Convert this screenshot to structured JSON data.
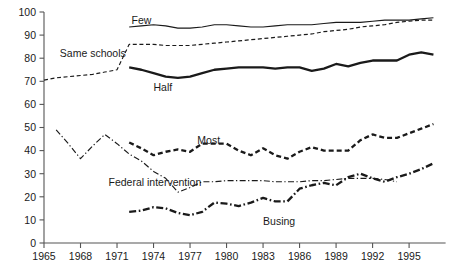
{
  "chart_data": {
    "type": "line",
    "title": "",
    "subtitle": "",
    "xlabel": "",
    "ylabel": "",
    "xlim": [
      1965,
      1998
    ],
    "ylim": [
      0,
      100
    ],
    "grid": false,
    "legend_position": "inline-annotations",
    "xticks": [
      1965,
      1968,
      1971,
      1974,
      1977,
      1980,
      1983,
      1986,
      1989,
      1992,
      1995
    ],
    "xtick_labels": [
      "1965",
      "1968",
      "1971",
      "1974",
      "1977",
      "1980",
      "1983",
      "1986",
      "1989",
      "1992",
      "1995"
    ],
    "yticks": [
      0,
      10,
      20,
      30,
      40,
      50,
      60,
      70,
      80,
      90,
      100
    ],
    "ytick_labels": [
      "0",
      "10",
      "20",
      "30",
      "40",
      "50",
      "60",
      "70",
      "80",
      "90",
      "100"
    ],
    "series": [
      {
        "name": "Few",
        "label": "Few",
        "style": "solid-thin",
        "color": "#333333",
        "label_x": 1972.2,
        "label_y": 96.5,
        "points": [
          [
            1972,
            93.5
          ],
          [
            1973,
            94.0
          ],
          [
            1974,
            94.5
          ],
          [
            1975,
            94.0
          ],
          [
            1976,
            93.0
          ],
          [
            1977,
            93.0
          ],
          [
            1978,
            93.5
          ],
          [
            1979,
            94.5
          ],
          [
            1980,
            94.5
          ],
          [
            1981,
            94.0
          ],
          [
            1982,
            93.5
          ],
          [
            1983,
            93.5
          ],
          [
            1984,
            94.0
          ],
          [
            1985,
            94.5
          ],
          [
            1986,
            94.5
          ],
          [
            1987,
            94.5
          ],
          [
            1988,
            95.0
          ],
          [
            1989,
            95.5
          ],
          [
            1990,
            95.5
          ],
          [
            1991,
            95.5
          ],
          [
            1992,
            96.0
          ],
          [
            1993,
            96.5
          ],
          [
            1994,
            96.5
          ],
          [
            1995,
            96.5
          ],
          [
            1996,
            97.0
          ],
          [
            1997,
            97.5
          ]
        ]
      },
      {
        "name": "Same schools",
        "label": "Same schools",
        "style": "dashed-thin",
        "color": "#222222",
        "label_x": 1966.3,
        "label_y": 82.0,
        "points": [
          [
            1965,
            70.5
          ],
          [
            1966,
            71.5
          ],
          [
            1967,
            72.0
          ],
          [
            1968,
            72.5
          ],
          [
            1969,
            73.0
          ],
          [
            1970,
            74.0
          ],
          [
            1971,
            75.0
          ],
          [
            1972,
            86.0
          ],
          [
            1973,
            86.0
          ],
          [
            1974,
            86.0
          ],
          [
            1975,
            85.5
          ],
          [
            1976,
            85.5
          ],
          [
            1977,
            85.5
          ],
          [
            1978,
            86.0
          ],
          [
            1979,
            86.5
          ],
          [
            1980,
            87.0
          ],
          [
            1981,
            87.5
          ],
          [
            1982,
            88.0
          ],
          [
            1983,
            88.5
          ],
          [
            1984,
            89.0
          ],
          [
            1985,
            89.5
          ],
          [
            1986,
            90.0
          ],
          [
            1987,
            90.5
          ],
          [
            1988,
            91.5
          ],
          [
            1989,
            92.0
          ],
          [
            1990,
            92.5
          ],
          [
            1991,
            93.5
          ],
          [
            1992,
            94.0
          ],
          [
            1993,
            94.5
          ],
          [
            1994,
            95.5
          ],
          [
            1995,
            96.0
          ],
          [
            1996,
            96.5
          ],
          [
            1997,
            96.5
          ]
        ]
      },
      {
        "name": "Half",
        "label": "Half",
        "style": "solid-thick",
        "color": "#111111",
        "label_x": 1974.0,
        "label_y": 67.5,
        "points": [
          [
            1972,
            76.0
          ],
          [
            1973,
            75.0
          ],
          [
            1974,
            73.5
          ],
          [
            1975,
            72.0
          ],
          [
            1976,
            71.5
          ],
          [
            1977,
            72.0
          ],
          [
            1978,
            73.5
          ],
          [
            1979,
            75.0
          ],
          [
            1980,
            75.5
          ],
          [
            1981,
            76.0
          ],
          [
            1982,
            76.0
          ],
          [
            1983,
            76.0
          ],
          [
            1984,
            75.5
          ],
          [
            1985,
            76.0
          ],
          [
            1986,
            76.0
          ],
          [
            1987,
            74.5
          ],
          [
            1988,
            75.5
          ],
          [
            1989,
            77.5
          ],
          [
            1990,
            76.5
          ],
          [
            1991,
            78.0
          ],
          [
            1992,
            79.0
          ],
          [
            1993,
            79.0
          ],
          [
            1994,
            79.0
          ],
          [
            1995,
            81.5
          ],
          [
            1996,
            82.5
          ],
          [
            1997,
            81.5
          ]
        ]
      },
      {
        "name": "Most",
        "label": "Most",
        "style": "dashed-thick",
        "color": "#111111",
        "label_x": 1977.6,
        "label_y": 44.5,
        "points": [
          [
            1972,
            43.5
          ],
          [
            1973,
            41.0
          ],
          [
            1974,
            38.0
          ],
          [
            1975,
            39.5
          ],
          [
            1976,
            40.5
          ],
          [
            1977,
            39.5
          ],
          [
            1978,
            43.0
          ],
          [
            1979,
            43.0
          ],
          [
            1980,
            43.0
          ],
          [
            1981,
            40.0
          ],
          [
            1982,
            38.0
          ],
          [
            1983,
            41.0
          ],
          [
            1984,
            38.0
          ],
          [
            1985,
            36.5
          ],
          [
            1986,
            39.5
          ],
          [
            1987,
            41.5
          ],
          [
            1988,
            40.0
          ],
          [
            1989,
            40.0
          ],
          [
            1990,
            40.0
          ],
          [
            1991,
            44.5
          ],
          [
            1992,
            47.0
          ],
          [
            1993,
            45.5
          ],
          [
            1994,
            45.5
          ],
          [
            1995,
            47.5
          ],
          [
            1996,
            49.5
          ],
          [
            1997,
            51.5
          ]
        ]
      },
      {
        "name": "Federal intervention",
        "label": "Federal intervention",
        "style": "dashdot-thin",
        "color": "#333333",
        "label_x": 1970.3,
        "label_y": 26.5,
        "points": [
          [
            1966,
            49.0
          ],
          [
            1967,
            43.0
          ],
          [
            1968,
            36.5
          ],
          [
            1969,
            42.0
          ],
          [
            1970,
            47.0
          ],
          [
            1971,
            43.0
          ],
          [
            1972,
            38.5
          ],
          [
            1973,
            35.5
          ],
          [
            1974,
            31.0
          ],
          [
            1975,
            28.0
          ],
          [
            1976,
            22.0
          ],
          [
            1977,
            24.0
          ],
          [
            1978,
            26.5
          ],
          [
            1979,
            26.5
          ],
          [
            1980,
            27.0
          ],
          [
            1981,
            27.0
          ],
          [
            1982,
            27.0
          ],
          [
            1983,
            27.0
          ],
          [
            1984,
            26.5
          ],
          [
            1985,
            26.5
          ],
          [
            1986,
            26.5
          ],
          [
            1987,
            27.0
          ],
          [
            1988,
            27.0
          ],
          [
            1989,
            27.5
          ],
          [
            1990,
            28.0
          ],
          [
            1991,
            28.0
          ],
          [
            1992,
            28.0
          ],
          [
            1993,
            27.5
          ],
          [
            1994,
            26.5
          ]
        ]
      },
      {
        "name": "Busing",
        "label": "Busing",
        "style": "dashdot-thick",
        "color": "#111111",
        "label_x": 1983.0,
        "label_y": 9.5,
        "points": [
          [
            1972,
            13.5
          ],
          [
            1973,
            14.0
          ],
          [
            1974,
            15.5
          ],
          [
            1975,
            15.0
          ],
          [
            1976,
            13.0
          ],
          [
            1977,
            12.0
          ],
          [
            1978,
            13.5
          ],
          [
            1979,
            17.5
          ],
          [
            1980,
            17.0
          ],
          [
            1981,
            16.0
          ],
          [
            1982,
            17.5
          ],
          [
            1983,
            19.5
          ],
          [
            1984,
            18.0
          ],
          [
            1985,
            18.0
          ],
          [
            1986,
            23.5
          ],
          [
            1987,
            25.0
          ],
          [
            1988,
            26.0
          ],
          [
            1989,
            25.0
          ],
          [
            1990,
            28.5
          ],
          [
            1991,
            30.0
          ],
          [
            1992,
            28.0
          ],
          [
            1993,
            26.5
          ],
          [
            1994,
            28.5
          ],
          [
            1995,
            30.0
          ],
          [
            1996,
            32.0
          ],
          [
            1997,
            34.5
          ]
        ]
      }
    ]
  },
  "axes": {
    "x_axis_name": "year-axis",
    "y_axis_name": "percent-axis"
  }
}
